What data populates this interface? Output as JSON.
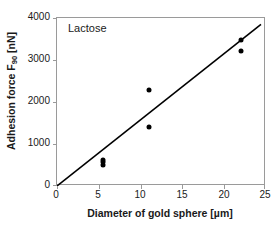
{
  "chart_data": {
    "type": "scatter",
    "title": "",
    "annotation": "Lactose",
    "xlabel": "Diameter of gold sphere [µm]",
    "ylabel_text": "Adhesion force F",
    "ylabel_sub": "90",
    "ylabel_unit": " [nN]",
    "ylabel_full": "Adhesion force F90 [nN]",
    "xlim": [
      0,
      25
    ],
    "ylim": [
      0,
      4000
    ],
    "xticks": [
      0,
      5,
      10,
      15,
      20,
      25
    ],
    "xtick_labels": [
      "0",
      "5",
      "10",
      "15",
      "20",
      "25"
    ],
    "yticks": [
      0,
      1000,
      2000,
      3000,
      4000
    ],
    "ytick_labels": [
      "0",
      "1000",
      "2000",
      "3000",
      "4000"
    ],
    "grid": false,
    "legend": null,
    "marker_color": "#000000",
    "line_color": "#000000",
    "frame_color": "#9a9a9a",
    "background": "#ffffff",
    "points": [
      {
        "x": 5.5,
        "y": 510
      },
      {
        "x": 5.5,
        "y": 570
      },
      {
        "x": 5.5,
        "y": 625
      },
      {
        "x": 11.0,
        "y": 2290
      },
      {
        "x": 11.0,
        "y": 1410
      },
      {
        "x": 22.0,
        "y": 3480
      },
      {
        "x": 22.0,
        "y": 3220
      }
    ],
    "fit_line": {
      "type": "linear",
      "through_origin": true,
      "x_start": 0,
      "y_start": 0,
      "x_end": 24.4,
      "y_end": 3850,
      "slope": 158
    }
  }
}
